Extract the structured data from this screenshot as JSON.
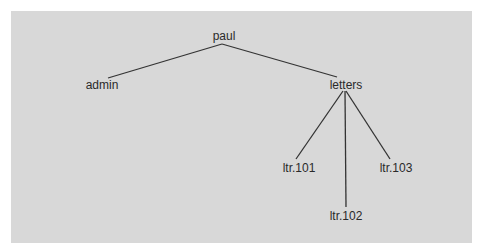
{
  "diagram": {
    "type": "directory-tree",
    "colors": {
      "background": "#d8d8d8",
      "border": "#ffffff",
      "line": "#333333",
      "text": "#2a2a2a"
    },
    "nodes": [
      {
        "id": "paul",
        "label": "paul",
        "x": 224,
        "y": 30
      },
      {
        "id": "admin",
        "label": "admin",
        "x": 102,
        "y": 79
      },
      {
        "id": "letters",
        "label": "letters",
        "x": 346,
        "y": 79
      },
      {
        "id": "ltr101",
        "label": "ltr.101",
        "x": 299,
        "y": 162
      },
      {
        "id": "ltr102",
        "label": "ltr.102",
        "x": 346,
        "y": 210
      },
      {
        "id": "ltr103",
        "label": "ltr.103",
        "x": 396,
        "y": 162
      }
    ],
    "edges": [
      {
        "from": "paul",
        "to": "admin",
        "x1": 222,
        "y1": 44,
        "x2": 108,
        "y2": 78
      },
      {
        "from": "paul",
        "to": "letters",
        "x1": 222,
        "y1": 44,
        "x2": 337,
        "y2": 77
      },
      {
        "from": "letters",
        "to": "ltr101",
        "x1": 343,
        "y1": 91,
        "x2": 296,
        "y2": 159
      },
      {
        "from": "letters",
        "to": "ltr102",
        "x1": 345,
        "y1": 91,
        "x2": 346,
        "y2": 207
      },
      {
        "from": "letters",
        "to": "ltr103",
        "x1": 346,
        "y1": 91,
        "x2": 390,
        "y2": 159
      }
    ]
  }
}
